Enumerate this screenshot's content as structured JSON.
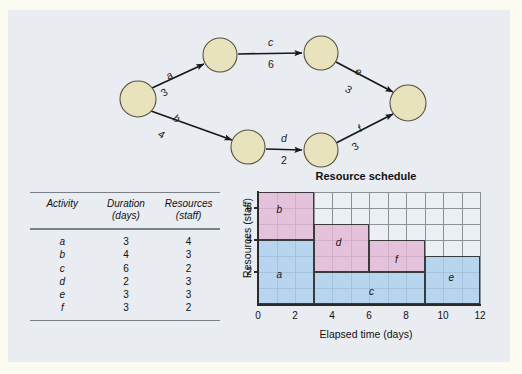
{
  "figure": {
    "panel_bg": "#e9ecf1",
    "outer_bg": "#fcfbf2"
  },
  "network": {
    "node_fill": "#e8e3bd",
    "nodes": [
      {
        "id": "start",
        "cx": 130,
        "cy": 89,
        "r": 18
      },
      {
        "id": "n1",
        "cx": 212,
        "cy": 45,
        "r": 17
      },
      {
        "id": "n2",
        "cx": 313,
        "cy": 43,
        "r": 17
      },
      {
        "id": "n3",
        "cx": 240,
        "cy": 137,
        "r": 17
      },
      {
        "id": "n4",
        "cx": 313,
        "cy": 140,
        "r": 17
      },
      {
        "id": "end",
        "cx": 400,
        "cy": 93,
        "r": 18
      }
    ],
    "edges": [
      {
        "id": "a",
        "label": "a",
        "duration": "3",
        "from": "start",
        "to": "n1"
      },
      {
        "id": "b",
        "label": "b",
        "duration": "4",
        "from": "start",
        "to": "n3"
      },
      {
        "id": "c",
        "label": "c",
        "duration": "6",
        "from": "n1",
        "to": "n2"
      },
      {
        "id": "d",
        "label": "d",
        "duration": "2",
        "from": "n3",
        "to": "n4"
      },
      {
        "id": "e",
        "label": "e",
        "duration": "3",
        "from": "n2",
        "to": "end"
      },
      {
        "id": "f",
        "label": "f",
        "duration": "3",
        "from": "n4",
        "to": "end"
      }
    ]
  },
  "table": {
    "headers_line1": [
      "Activity",
      "Duration",
      "Resources"
    ],
    "headers_line2": [
      "",
      "(days)",
      "(staff)"
    ],
    "rows": [
      {
        "activity": "a",
        "duration": "3",
        "resources": "4"
      },
      {
        "activity": "b",
        "duration": "4",
        "resources": "3"
      },
      {
        "activity": "c",
        "duration": "6",
        "resources": "2"
      },
      {
        "activity": "d",
        "duration": "2",
        "resources": "3"
      },
      {
        "activity": "e",
        "duration": "3",
        "resources": "3"
      },
      {
        "activity": "f",
        "duration": "3",
        "resources": "2"
      }
    ]
  },
  "chart_title": "Resource schedule",
  "chart_data": {
    "type": "bar",
    "title": "Resource schedule",
    "xlabel": "Elapsed time (days)",
    "ylabel": "Resources (staff)",
    "xlim": [
      0,
      12
    ],
    "ylim": [
      0,
      7
    ],
    "xticks": [
      "0",
      "2",
      "4",
      "6",
      "8",
      "10",
      "12"
    ],
    "xtick_values": [
      0,
      2,
      4,
      6,
      8,
      10,
      12
    ],
    "yticks": [
      "2",
      "4",
      "6"
    ],
    "ytick_values": [
      2,
      4,
      6
    ],
    "grid": true,
    "grid_step_x": 1,
    "grid_step_y": 1,
    "legend": "none",
    "colors": {
      "pink": "#e4b7d6",
      "blue": "#aaceec",
      "border": "#3a3a3a"
    },
    "blocks": [
      {
        "label": "b",
        "x0": 0,
        "x1": 3,
        "y0": 4,
        "y1": 7,
        "color": "pink",
        "label_x": 1.0,
        "label_y": 5.9
      },
      {
        "label": "a",
        "x0": 0,
        "x1": 3,
        "y0": 0,
        "y1": 4,
        "color": "blue",
        "label_x": 1.0,
        "label_y": 1.8
      },
      {
        "label": "d",
        "x0": 3,
        "x1": 6,
        "y0": 2,
        "y1": 5,
        "color": "pink",
        "label_x": 4.2,
        "label_y": 3.8
      },
      {
        "label": "c",
        "x0": 3,
        "x1": 9,
        "y0": 0,
        "y1": 2,
        "color": "blue",
        "label_x": 6.0,
        "label_y": 0.75
      },
      {
        "label": "f",
        "x0": 6,
        "x1": 9,
        "y0": 2,
        "y1": 4,
        "color": "pink",
        "label_x": 7.4,
        "label_y": 2.75
      },
      {
        "label": "e",
        "x0": 9,
        "x1": 12,
        "y0": 0,
        "y1": 3,
        "color": "blue",
        "label_x": 10.3,
        "label_y": 1.6
      }
    ]
  }
}
